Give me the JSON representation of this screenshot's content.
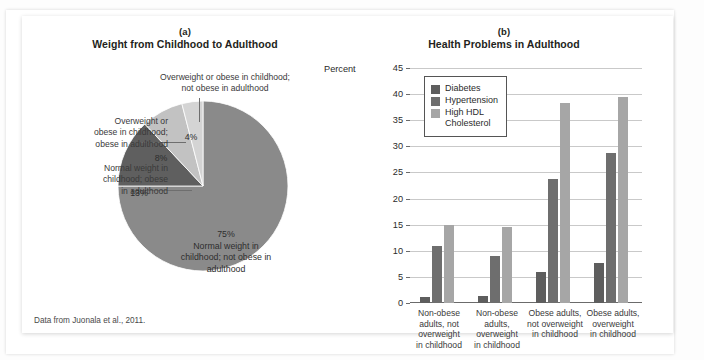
{
  "figure": {
    "footnote": "Data from Juonala et al., 2011."
  },
  "panel_a": {
    "letter": "(a)",
    "title": "Weight from Childhood to Adulthood",
    "callouts": [
      "Overweight or obese in childhood;\nnot obese in adulthood",
      "Overweight or\nobese in childhood;\nobese in adulthood",
      "Normal weight in\nchildhood; obese\nin adulthood"
    ],
    "slice_labels": {
      "four": "4%",
      "eight": "8%",
      "thirteen": "13%",
      "seventyfive": "75%\nNormal weight in\nchildhood; not obese in\nadulthood"
    }
  },
  "panel_b": {
    "letter": "(b)",
    "title": "Health Problems in Adulthood",
    "axis_name": "Percent",
    "legend": [
      "Diabetes",
      "Hypertension",
      "High HDL\nCholesterol"
    ]
  },
  "colors": {
    "diabetes": "#5e5e5e",
    "hypertension": "#6e6e6e",
    "hdl": "#a6a6a6",
    "pie_75": "#8a8a8a",
    "pie_13": "#5f5f5f",
    "pie_8": "#c2c2c2",
    "pie_4": "#d4d4d4",
    "grid": "#c9c9c9",
    "axis": "#6b6b6b"
  },
  "chart_data": [
    {
      "type": "pie",
      "title": "Weight from Childhood to Adulthood",
      "panel": "(a)",
      "labels": [
        "Normal weight in childhood; not obese in adulthood",
        "Normal weight in childhood; obese in adulthood",
        "Overweight or obese in childhood; obese in adulthood",
        "Overweight or obese in childhood; not obese in adulthood"
      ],
      "values": [
        75,
        13,
        8,
        4
      ],
      "value_labels": [
        "75%",
        "13%",
        "8%",
        "4%"
      ],
      "colors": [
        "#8a8a8a",
        "#5f5f5f",
        "#c2c2c2",
        "#d4d4d4"
      ],
      "units": "percent",
      "legend": "none (direct labels with leader lines)",
      "source": "Data from Juonala et al., 2011."
    },
    {
      "type": "bar",
      "title": "Health Problems in Adulthood",
      "panel": "(b)",
      "xlabel": "",
      "ylabel": "Percent",
      "ylim": [
        0,
        45
      ],
      "yticks": [
        0,
        5,
        10,
        15,
        20,
        25,
        30,
        35,
        40,
        45
      ],
      "ytick_labels": [
        "0",
        "5",
        "10",
        "15",
        "20",
        "25",
        "30",
        "35",
        "40",
        "45"
      ],
      "grid": "horizontal",
      "legend_position": "upper-left inside plot",
      "categories": [
        "Non-obese adults, not overweight in childhood",
        "Non-obese adults, overweight in childhood",
        "Obese adults, not overweight in childhood",
        "Obese adults, overweight in childhood"
      ],
      "category_labels": [
        "Non-obese\nadults, not\noverweight\nin childhood",
        "Non-obese\nadults,\noverweight\nin childhood",
        "Obese adults,\nnot overweight\nin childhood",
        "Obese adults,\noverweight\nin childhood"
      ],
      "series": [
        {
          "name": "Diabetes",
          "color": "#5e5e5e",
          "values": [
            1.2,
            1.3,
            6.0,
            7.7
          ]
        },
        {
          "name": "Hypertension",
          "color": "#6e6e6e",
          "values": [
            11.0,
            9.0,
            23.8,
            28.7
          ]
        },
        {
          "name": "High HDL Cholesterol",
          "color": "#a6a6a6",
          "values": [
            15.0,
            14.5,
            38.3,
            39.5
          ]
        }
      ]
    }
  ]
}
